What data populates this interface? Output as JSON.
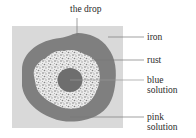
{
  "diagram": {
    "type": "rust-indicator-drop-on-iron",
    "labels": {
      "drop": "the drop",
      "iron": "iron",
      "rust": "rust",
      "blue_solution_line1": "blue",
      "blue_solution_line2": "solution",
      "pink_solution_line1": "pink",
      "pink_solution_line2": "solution"
    },
    "colors": {
      "iron": "#d9d9d9",
      "pink_solution": "#7f7f7f",
      "rust": "#e6e6e6",
      "rust_speckle": "#8a8a8a",
      "blue_solution": "#6e6e6e",
      "leader_line": "#7a7a7a"
    }
  }
}
